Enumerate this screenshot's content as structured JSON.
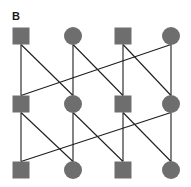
{
  "panel": {
    "label": "B"
  },
  "colors": {
    "node_fill": "#6e6e6e",
    "edge": "#1e1e1e",
    "background": "#ffffff"
  },
  "nodes": [
    {
      "id": "r1c1",
      "shape": "square",
      "x": 21,
      "y": 36
    },
    {
      "id": "r1c2",
      "shape": "circle",
      "x": 73,
      "y": 36
    },
    {
      "id": "r1c3",
      "shape": "square",
      "x": 123,
      "y": 36
    },
    {
      "id": "r1c4",
      "shape": "circle",
      "x": 171,
      "y": 36
    },
    {
      "id": "r2c1",
      "shape": "square",
      "x": 21,
      "y": 104
    },
    {
      "id": "r2c2",
      "shape": "circle",
      "x": 73,
      "y": 104
    },
    {
      "id": "r2c3",
      "shape": "square",
      "x": 123,
      "y": 104
    },
    {
      "id": "r2c4",
      "shape": "circle",
      "x": 171,
      "y": 104
    },
    {
      "id": "r3c1",
      "shape": "square",
      "x": 21,
      "y": 170
    },
    {
      "id": "r3c2",
      "shape": "circle",
      "x": 73,
      "y": 170
    },
    {
      "id": "r3c3",
      "shape": "square",
      "x": 123,
      "y": 170
    },
    {
      "id": "r3c4",
      "shape": "circle",
      "x": 171,
      "y": 170
    }
  ],
  "edges": [
    [
      "r1c1",
      "r2c1"
    ],
    [
      "r1c1",
      "r2c2"
    ],
    [
      "r1c2",
      "r2c2"
    ],
    [
      "r1c2",
      "r2c3"
    ],
    [
      "r1c3",
      "r2c3"
    ],
    [
      "r1c3",
      "r2c4"
    ],
    [
      "r1c4",
      "r2c4"
    ],
    [
      "r1c4",
      "r2c1"
    ],
    [
      "r2c1",
      "r3c1"
    ],
    [
      "r2c1",
      "r3c2"
    ],
    [
      "r2c2",
      "r3c2"
    ],
    [
      "r2c2",
      "r3c3"
    ],
    [
      "r2c3",
      "r3c3"
    ],
    [
      "r2c3",
      "r3c4"
    ],
    [
      "r2c4",
      "r3c4"
    ],
    [
      "r2c4",
      "r3c1"
    ]
  ],
  "node_size": 17
}
